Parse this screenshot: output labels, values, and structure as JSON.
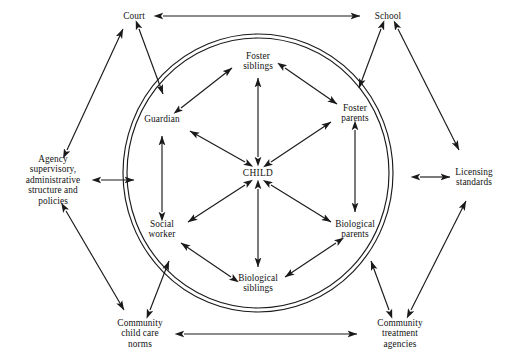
{
  "diagram": {
    "type": "ecomap",
    "stroke_color": "#1a1a1a",
    "background_color": "#ffffff",
    "inner_boundary": {
      "shape": "double-ellipse",
      "cx": 258,
      "cy": 173,
      "rx": 135,
      "ry": 139,
      "gap": 4
    },
    "inner_nodes": [
      {
        "id": "child",
        "label": "CHILD",
        "x": 258,
        "y": 173
      },
      {
        "id": "foster-siblings",
        "label": "Foster\nsiblings",
        "x": 258,
        "y": 61
      },
      {
        "id": "foster-parents",
        "label": "Foster\nparents",
        "x": 355,
        "y": 113
      },
      {
        "id": "biological-parents",
        "label": "Biological\nparents",
        "x": 355,
        "y": 229
      },
      {
        "id": "biological-siblings",
        "label": "Biological\nsiblings",
        "x": 258,
        "y": 283
      },
      {
        "id": "social-worker",
        "label": "Social\nworker",
        "x": 162,
        "y": 229
      },
      {
        "id": "guardian",
        "label": "Guardian",
        "x": 162,
        "y": 119
      }
    ],
    "outer_nodes": [
      {
        "id": "court",
        "label": "Court",
        "x": 134,
        "y": 16
      },
      {
        "id": "school",
        "label": "School",
        "x": 388,
        "y": 16
      },
      {
        "id": "agency",
        "label": "Agency\nsupervisory,\nadministrative\nstructure and\npolicies",
        "x": 53,
        "y": 180
      },
      {
        "id": "licensing-standards",
        "label": "Licensing\nstandards",
        "x": 474,
        "y": 177
      },
      {
        "id": "community-child-care-norms",
        "label": "Community\nchild care\nnorms",
        "x": 140,
        "y": 334
      },
      {
        "id": "community-treatment-agencies",
        "label": "Community\ntreatment\nagencies",
        "x": 400,
        "y": 334
      }
    ],
    "edges": [
      {
        "from": "child",
        "to": "foster-siblings",
        "arrows": "both",
        "group": "inner-spoke"
      },
      {
        "from": "child",
        "to": "foster-parents",
        "arrows": "both",
        "group": "inner-spoke"
      },
      {
        "from": "child",
        "to": "biological-parents",
        "arrows": "both",
        "group": "inner-spoke"
      },
      {
        "from": "child",
        "to": "biological-siblings",
        "arrows": "both",
        "group": "inner-spoke"
      },
      {
        "from": "child",
        "to": "social-worker",
        "arrows": "both",
        "group": "inner-spoke"
      },
      {
        "from": "child",
        "to": "guardian",
        "arrows": "both",
        "group": "inner-spoke"
      },
      {
        "from": "guardian",
        "to": "foster-siblings",
        "arrows": "both",
        "group": "inner-ring"
      },
      {
        "from": "foster-siblings",
        "to": "foster-parents",
        "arrows": "both",
        "group": "inner-ring"
      },
      {
        "from": "foster-parents",
        "to": "biological-parents",
        "arrows": "both",
        "group": "inner-ring"
      },
      {
        "from": "biological-parents",
        "to": "biological-siblings",
        "arrows": "both",
        "group": "inner-ring"
      },
      {
        "from": "biological-siblings",
        "to": "social-worker",
        "arrows": "both",
        "group": "inner-ring"
      },
      {
        "from": "social-worker",
        "to": "guardian",
        "arrows": "both",
        "group": "inner-ring"
      },
      {
        "from": "court",
        "to": "school",
        "arrows": "both",
        "group": "outer-perimeter"
      },
      {
        "from": "community-child-care-norms",
        "to": "community-treatment-agencies",
        "arrows": "both",
        "group": "outer-perimeter"
      },
      {
        "from": "agency",
        "to": "court",
        "arrows": "both",
        "group": "outer-link"
      },
      {
        "from": "court",
        "to": "guardian",
        "arrows": "both",
        "group": "outer-link"
      },
      {
        "from": "school",
        "to": "foster-parents",
        "arrows": "both",
        "group": "outer-link"
      },
      {
        "from": "school",
        "to": "licensing-standards",
        "arrows": "both",
        "group": "outer-link"
      },
      {
        "from": "agency",
        "to": "inner-boundary-left",
        "arrows": "both",
        "group": "outer-link"
      },
      {
        "from": "licensing-standards",
        "to": "inner-boundary-right",
        "arrows": "both",
        "group": "outer-link"
      },
      {
        "from": "agency",
        "to": "community-child-care-norms",
        "arrows": "both",
        "group": "outer-link"
      },
      {
        "from": "community-child-care-norms",
        "to": "social-worker",
        "arrows": "both",
        "group": "outer-link"
      },
      {
        "from": "community-treatment-agencies",
        "to": "biological-parents",
        "arrows": "both",
        "group": "outer-link"
      },
      {
        "from": "community-treatment-agencies",
        "to": "licensing-standards",
        "arrows": "both",
        "group": "outer-link"
      }
    ]
  }
}
